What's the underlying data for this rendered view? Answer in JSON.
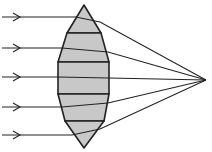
{
  "diagram": {
    "title": "Segmented prism lens approximating a converging lens",
    "colors": {
      "stroke": "#222222",
      "fill": "#c8c8c8",
      "background": "#ffffff"
    },
    "focal_point": {
      "x": 206,
      "y": 80
    },
    "rays": [
      {
        "y_in": 17,
        "x_hit": 76,
        "y_exit": 22,
        "x_exit": 100
      },
      {
        "y_in": 48,
        "x_hit": 62,
        "y_exit": 52,
        "x_exit": 108
      },
      {
        "y_in": 77,
        "x_hit": 58,
        "y_exit": 78,
        "x_exit": 109
      },
      {
        "y_in": 107,
        "x_hit": 62,
        "y_exit": 103,
        "x_exit": 108
      },
      {
        "y_in": 135,
        "x_hit": 72,
        "y_exit": 129,
        "x_exit": 100
      }
    ],
    "segments": [
      {
        "name": "top-prism",
        "points": "84,5 67,33 101,33"
      },
      {
        "name": "upper-prism",
        "points": "67,33 101,33 109,62 58,62"
      },
      {
        "name": "center-block",
        "points": "58,62 109,62 109,94 58,94"
      },
      {
        "name": "lower-prism",
        "points": "58,94 109,94 104,121 65,121"
      },
      {
        "name": "bottom-prism",
        "points": "65,121 104,121 84,148"
      }
    ]
  }
}
